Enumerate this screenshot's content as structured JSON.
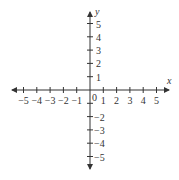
{
  "chart_data": {
    "type": "coordinate-plane",
    "title": "",
    "xlabel": "x",
    "ylabel": "y",
    "xlim": [
      -5,
      5
    ],
    "ylim": [
      -5,
      5
    ],
    "x_ticks": [
      -5,
      -4,
      -3,
      -2,
      -1,
      1,
      2,
      3,
      4,
      5
    ],
    "y_ticks": [
      -5,
      -4,
      -3,
      -2,
      -1,
      1,
      2,
      3,
      4,
      5
    ],
    "x_tick_labels": [
      "−5",
      "−4",
      "−3",
      "−2",
      "−1",
      "1",
      "2",
      "3",
      "4",
      "5"
    ],
    "y_tick_labels_positive": [
      "1",
      "2",
      "3",
      "4",
      "5"
    ],
    "y_tick_labels_negative": [
      "−2",
      "−3",
      "−4",
      "−5"
    ],
    "origin_label": "0",
    "grid": false,
    "arrows": "both ends on both axes"
  },
  "colors": {
    "axis": "#333333",
    "background": "#ffffff"
  }
}
